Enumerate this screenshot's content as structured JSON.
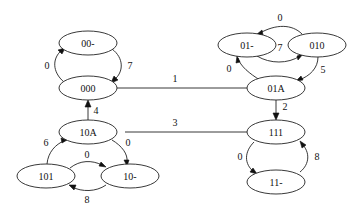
{
  "diagram": {
    "type": "state-transition-graph",
    "nodes": [
      {
        "id": "n00d",
        "label": "00-",
        "cx": 88,
        "cy": 43
      },
      {
        "id": "n000",
        "label": "000",
        "cx": 88,
        "cy": 88
      },
      {
        "id": "n01d",
        "label": "01-",
        "cx": 247,
        "cy": 45
      },
      {
        "id": "n010",
        "label": "010",
        "cx": 317,
        "cy": 45
      },
      {
        "id": "n01A",
        "label": "01A",
        "cx": 276,
        "cy": 88
      },
      {
        "id": "n111",
        "label": "111",
        "cx": 276,
        "cy": 132
      },
      {
        "id": "n11d",
        "label": "11-",
        "cx": 276,
        "cy": 182
      },
      {
        "id": "n10A",
        "label": "10A",
        "cx": 88,
        "cy": 132
      },
      {
        "id": "n101",
        "label": "101",
        "cx": 46,
        "cy": 176
      },
      {
        "id": "n10d",
        "label": "10-",
        "cx": 130,
        "cy": 176
      }
    ],
    "edges": [
      {
        "from": "000",
        "to": "00-",
        "label": "0"
      },
      {
        "from": "00-",
        "to": "000",
        "label": "7"
      },
      {
        "from": "000",
        "to": "01A",
        "label": "1",
        "undirected": true
      },
      {
        "from": "010",
        "to": "01-",
        "label": "0"
      },
      {
        "from": "01-",
        "to": "010",
        "label": "7"
      },
      {
        "from": "01A",
        "to": "01-",
        "label": "0"
      },
      {
        "from": "010",
        "to": "01A",
        "label": "5"
      },
      {
        "from": "01A",
        "to": "111",
        "label": "2"
      },
      {
        "from": "10A",
        "to": "000",
        "label": "4"
      },
      {
        "from": "10A",
        "to": "111",
        "label": "3",
        "undirected": true
      },
      {
        "from": "101",
        "to": "10A",
        "label": "6"
      },
      {
        "from": "10A",
        "to": "10-",
        "label": "0"
      },
      {
        "from": "101",
        "to": "10-",
        "label": "0"
      },
      {
        "from": "10-",
        "to": "101",
        "label": "8"
      },
      {
        "from": "111",
        "to": "11-",
        "label": "0"
      },
      {
        "from": "11-",
        "to": "111",
        "label": "8"
      }
    ]
  }
}
